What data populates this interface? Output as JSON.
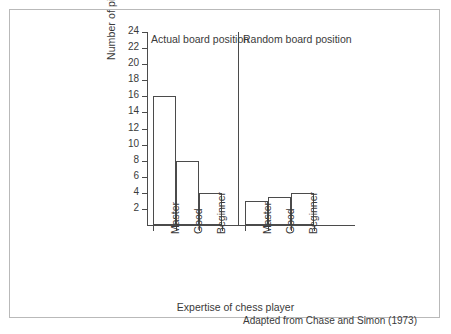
{
  "chart_data": {
    "type": "bar",
    "title": "",
    "subtitle": "",
    "xlabel": "Expertise of chess player",
    "ylabel": "Number of pieces correctly placed",
    "ylim": [
      0,
      24
    ],
    "ytick_step": 2,
    "yticks": [
      2,
      4,
      6,
      8,
      10,
      12,
      14,
      16,
      18,
      20,
      22,
      24
    ],
    "grid": false,
    "legend": "none",
    "categories": [
      "Master",
      "Good",
      "Beginner"
    ],
    "panels": [
      {
        "name": "Actual board position",
        "categories": [
          "Master",
          "Good",
          "Beginner"
        ],
        "values": [
          16,
          8,
          4
        ]
      },
      {
        "name": "Random board position",
        "categories": [
          "Master",
          "Good",
          "Beginner"
        ],
        "values": [
          3,
          3.5,
          4
        ]
      }
    ],
    "series": [
      {
        "name": "Actual board position",
        "values": [
          16,
          8,
          4
        ]
      },
      {
        "name": "Random board position",
        "values": [
          3,
          3.5,
          4
        ]
      }
    ],
    "annotation": "Adapted from Chase and Simon (1973)",
    "bar_fill_color": "#ffffff",
    "bar_edge_color": "#4b4b4b",
    "axis_color": "#4b4b4b",
    "frame_color": "#b9b9b9",
    "text_color": "#3a3a3a"
  },
  "figure": {
    "y_axis_title": "Number of pieces correctly placed",
    "x_axis_title": "Expertise of chess player",
    "attribution": "Adapted from Chase and Simon (1973)",
    "panel_labels": {
      "actual": "Actual board position",
      "random": "Random board position"
    }
  }
}
